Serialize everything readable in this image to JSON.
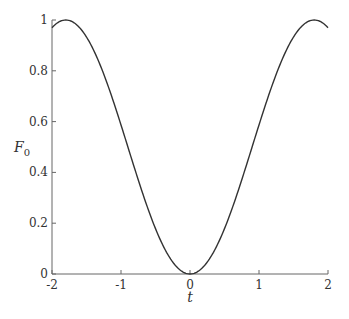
{
  "chart_data": {
    "type": "line",
    "title": "",
    "xlabel": "t",
    "ylabel": "F_0",
    "ylabel_main": "F",
    "ylabel_sub": "0",
    "xlim": [
      -2,
      2
    ],
    "ylim": [
      0,
      1
    ],
    "grid": false,
    "legend": null,
    "x_ticks": [
      "-2",
      "-1",
      "0",
      "1",
      "2"
    ],
    "y_ticks": [
      "0",
      "0.2",
      "0.4",
      "0.6",
      "0.8",
      "1"
    ],
    "series": [
      {
        "name": "F_0(t)",
        "color": "#333333",
        "x": [
          -2.0,
          -1.8,
          -1.6,
          -1.4,
          -1.2,
          -1.0,
          -0.8,
          -0.6,
          -0.4,
          -0.2,
          0.0,
          0.2,
          0.4,
          0.6,
          0.8,
          1.0,
          1.2,
          1.4,
          1.6,
          1.8,
          2.0
        ],
        "values": [
          0.97,
          1.0,
          0.97,
          0.88,
          0.75,
          0.59,
          0.41,
          0.25,
          0.12,
          0.03,
          0.0,
          0.03,
          0.12,
          0.25,
          0.41,
          0.59,
          0.75,
          0.88,
          0.97,
          1.0,
          0.97
        ]
      }
    ]
  }
}
